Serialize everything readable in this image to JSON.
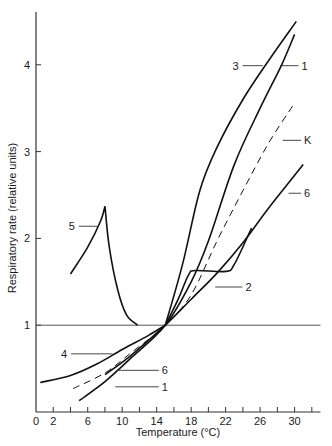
{
  "chart_data": {
    "type": "line",
    "title": "",
    "xlabel": "Temperature (°C)",
    "ylabel": "Respiratory rate  (relative units)",
    "xlim": [
      0,
      33
    ],
    "ylim": [
      0,
      4.6
    ],
    "x_ticks": [
      0,
      2,
      4,
      6,
      8,
      10,
      12,
      14,
      16,
      18,
      20,
      22,
      24,
      26,
      28,
      30,
      32
    ],
    "x_tick_labels": [
      "0",
      "2",
      "6",
      "10",
      "14",
      "18",
      "22",
      "26",
      "30"
    ],
    "x_tick_label_values": [
      0,
      2,
      6,
      10,
      14,
      18,
      22,
      26,
      30
    ],
    "y_ticks": [
      1,
      2,
      3,
      4
    ],
    "y_tick_labels": [
      "1",
      "2",
      "3",
      "4"
    ],
    "grid": false,
    "reference_line": {
      "y": 1,
      "x_from": 0,
      "x_to": 33
    },
    "series": [
      {
        "name": "3",
        "style": "solid",
        "x": [
          15,
          17,
          19,
          21,
          24,
          27,
          30.2
        ],
        "y": [
          1,
          1.7,
          2.55,
          3.05,
          3.6,
          4.05,
          4.5
        ],
        "label": {
          "text": "3",
          "at": [
            23.5,
            3.99
          ],
          "leader_to": [
            26.3,
            3.99
          ],
          "side": "left"
        }
      },
      {
        "name": "1",
        "style": "solid",
        "x": [
          5,
          8,
          11,
          15,
          18,
          20,
          23,
          26,
          28.5,
          30
        ],
        "y": [
          0.13,
          0.35,
          0.62,
          1,
          1.5,
          1.97,
          2.85,
          3.5,
          4.0,
          4.35
        ],
        "label": {
          "text": "1",
          "at": [
            30.8,
            3.99
          ],
          "leader_to": [
            28.3,
            3.99
          ],
          "side": "right"
        },
        "label_lower": {
          "text": "1",
          "at": [
            14.6,
            0.29
          ],
          "leader_to": [
            9.2,
            0.29
          ],
          "side": "right"
        }
      },
      {
        "name": "K",
        "style": "dashed",
        "x": [
          4.3,
          8,
          11,
          15,
          18,
          21,
          24,
          27,
          29.8
        ],
        "y": [
          0.27,
          0.45,
          0.68,
          1,
          1.35,
          1.97,
          2.55,
          3.1,
          3.53
        ],
        "label": {
          "text": "K",
          "at": [
            31.1,
            3.13
          ],
          "leader_to": [
            28.6,
            3.13
          ],
          "side": "right"
        }
      },
      {
        "name": "6",
        "style": "solid",
        "x": [
          8,
          11,
          15,
          18,
          21,
          24,
          27,
          31
        ],
        "y": [
          0.43,
          0.65,
          1,
          1.3,
          1.6,
          1.95,
          2.35,
          2.85
        ],
        "label": {
          "text": "6",
          "at": [
            31.1,
            2.52
          ],
          "leader_to": [
            29.3,
            2.52
          ],
          "side": "right"
        },
        "label_lower": {
          "text": "6",
          "at": [
            14.6,
            0.48
          ],
          "leader_to": [
            9.4,
            0.48
          ],
          "side": "right"
        }
      },
      {
        "name": "2",
        "style": "solid",
        "x": [
          15,
          16.5,
          17.7,
          18.5,
          22,
          23,
          25
        ],
        "y": [
          1,
          1.3,
          1.58,
          1.63,
          1.62,
          1.7,
          2.12
        ],
        "label": {
          "text": "2",
          "at": [
            24.3,
            1.44
          ],
          "leader_to": [
            20.8,
            1.44
          ],
          "side": "right"
        }
      },
      {
        "name": "4",
        "style": "solid",
        "x": [
          0.5,
          4,
          7,
          10,
          13,
          15
        ],
        "y": [
          0.34,
          0.42,
          0.55,
          0.72,
          0.88,
          1
        ],
        "label": {
          "text": "4",
          "at": [
            3.6,
            0.67
          ],
          "leader_to": [
            8.9,
            0.67
          ],
          "side": "left"
        }
      },
      {
        "name": "5",
        "style": "solid",
        "x": [
          4,
          6,
          7.5,
          8,
          8.5,
          9.5,
          10.5,
          11.8
        ],
        "y": [
          1.59,
          1.9,
          2.2,
          2.37,
          1.9,
          1.4,
          1.12,
          1.0
        ],
        "label": {
          "text": "5",
          "at": [
            4.5,
            2.14
          ],
          "leader_to": [
            7.1,
            2.14
          ],
          "side": "left"
        }
      }
    ]
  }
}
